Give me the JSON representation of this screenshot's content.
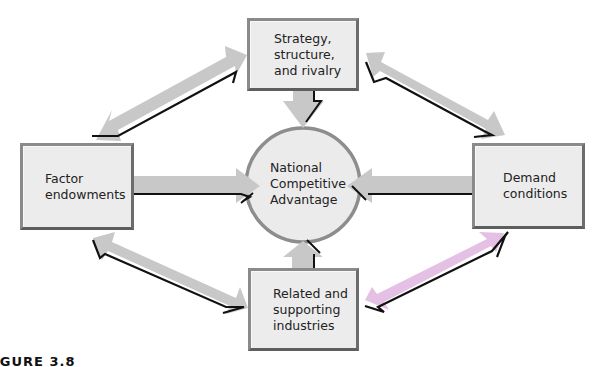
{
  "diagram": {
    "title": "National Competitive Advantage",
    "nodes": {
      "top": {
        "label": "Strategy,\nstructure,\nand rivalry"
      },
      "left": {
        "label": "Factor\nendowments"
      },
      "right": {
        "label": "Demand\nconditions"
      },
      "bottom": {
        "label": "Related and\nsupporting\nindustries"
      },
      "center": {
        "label": "National\nCompetitive\nAdvantage"
      }
    },
    "edges": [
      {
        "from": "top",
        "to": "center",
        "type": "single-arrow"
      },
      {
        "from": "left",
        "to": "center",
        "type": "single-arrow"
      },
      {
        "from": "right",
        "to": "center",
        "type": "single-arrow"
      },
      {
        "from": "bottom",
        "to": "center",
        "type": "single-arrow"
      },
      {
        "from": "top",
        "to": "left",
        "type": "double-arrow"
      },
      {
        "from": "top",
        "to": "right",
        "type": "double-arrow"
      },
      {
        "from": "bottom",
        "to": "left",
        "type": "double-arrow"
      },
      {
        "from": "bottom",
        "to": "right",
        "type": "double-arrow"
      }
    ],
    "colors": {
      "arrow_fill": "#c8c8c8",
      "arrow_shadow": "#111111",
      "box_fill": "#ececec",
      "box_border": "#7a7a7a",
      "circle_fill": "#ebebeb",
      "circle_border": "#8a8a8a"
    }
  },
  "caption": "IGURE 3.8"
}
